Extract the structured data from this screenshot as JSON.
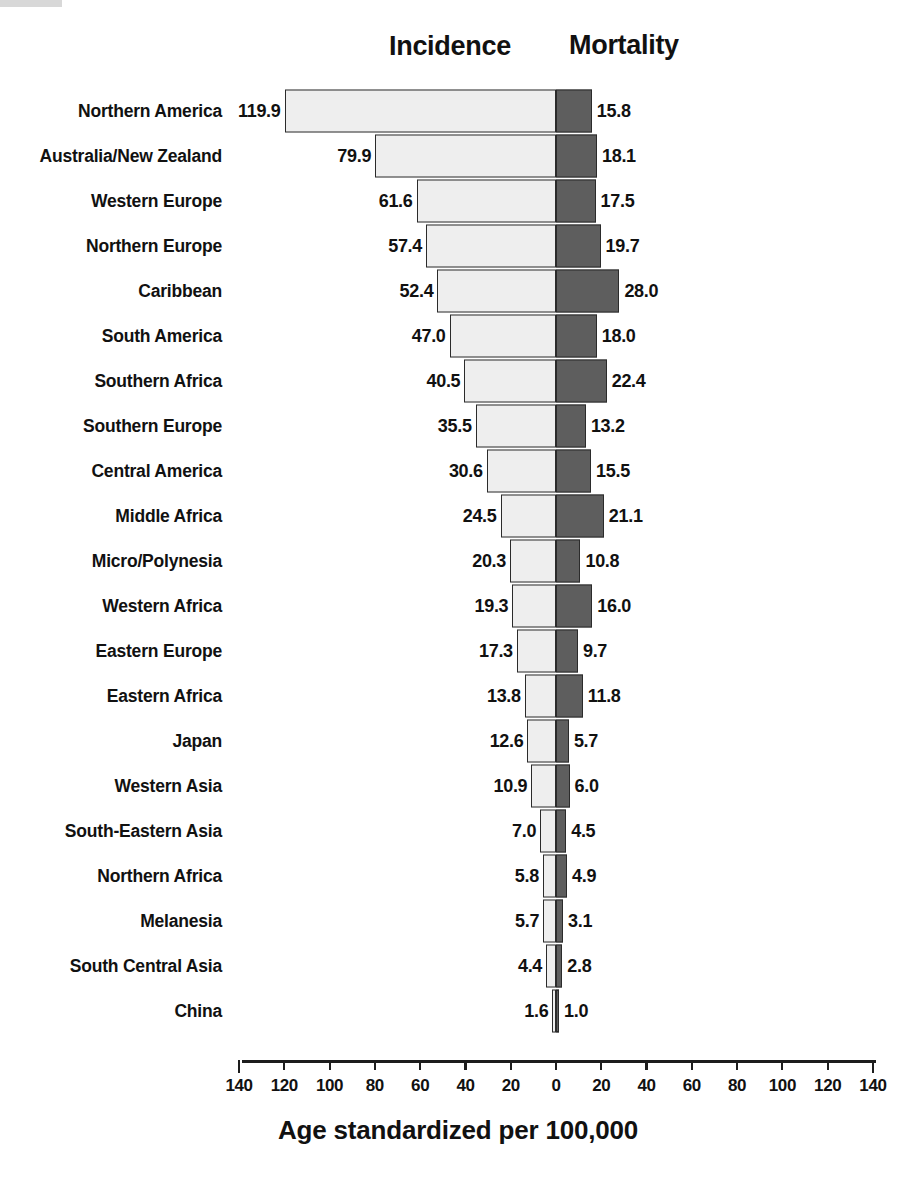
{
  "figure": {
    "caption": "Age standardized per 100,000",
    "scan_artifact": "scanner-edge-artifact"
  },
  "headers": {
    "left": "Incidence",
    "right": "Mortality"
  },
  "chart_data": {
    "type": "bar",
    "orientation": "horizontal-diverging",
    "title": "",
    "subtitle": "",
    "xlabel": "Age standardized per 100,000",
    "ylabel": "",
    "grid": false,
    "legend_position": "top",
    "axis": {
      "ticks_left": [
        140,
        120,
        100,
        80,
        60,
        40,
        20,
        0
      ],
      "ticks_right": [
        20,
        40,
        60,
        80,
        100,
        120,
        140
      ],
      "tick_labels": [
        "140",
        "120",
        "100",
        "80",
        "60",
        "40",
        "20",
        "0",
        "20",
        "40",
        "60",
        "80",
        "100",
        "120",
        "140"
      ],
      "xlim_left": [
        0,
        140
      ],
      "xlim_right": [
        0,
        140
      ],
      "tick_step": 20
    },
    "categories": [
      "Northern America",
      "Australia/New Zealand",
      "Western Europe",
      "Northern Europe",
      "Caribbean",
      "South America",
      "Southern Africa",
      "Southern Europe",
      "Central America",
      "Middle Africa",
      "Micro/Polynesia",
      "Western Africa",
      "Eastern Europe",
      "Eastern Africa",
      "Japan",
      "Western Asia",
      "South-Eastern Asia",
      "Northern Africa",
      "Melanesia",
      "South Central Asia",
      "China"
    ],
    "series": [
      {
        "name": "Incidence",
        "side": "left",
        "color": "#eeeeee",
        "values": [
          119.9,
          79.9,
          61.6,
          57.4,
          52.4,
          47.0,
          40.5,
          35.5,
          30.6,
          24.5,
          20.3,
          19.3,
          17.3,
          13.8,
          12.6,
          10.9,
          7.0,
          5.8,
          5.7,
          4.4,
          1.6
        ],
        "labels": [
          "119.9",
          "79.9",
          "61.6",
          "57.4",
          "52.4",
          "47.0",
          "40.5",
          "35.5",
          "30.6",
          "24.5",
          "20.3",
          "19.3",
          "17.3",
          "13.8",
          "12.6",
          "10.9",
          "7.0",
          "5.8",
          "5.7",
          "4.4",
          "1.6"
        ]
      },
      {
        "name": "Mortality",
        "side": "right",
        "color": "#5e5e5e",
        "values": [
          15.8,
          18.1,
          17.5,
          19.7,
          28.0,
          18.0,
          22.4,
          13.2,
          15.5,
          21.1,
          10.8,
          16.0,
          9.7,
          11.8,
          5.7,
          6.0,
          4.5,
          4.9,
          3.1,
          2.8,
          1.0
        ],
        "labels": [
          "15.8",
          "18.1",
          "17.5",
          "19.7",
          "28.0",
          "18.0",
          "22.4",
          "13.2",
          "15.5",
          "21.1",
          "10.8",
          "16.0",
          "9.7",
          "11.8",
          "5.7",
          "6.0",
          "4.5",
          "4.9",
          "3.1",
          "2.8",
          "1.0"
        ]
      }
    ]
  }
}
